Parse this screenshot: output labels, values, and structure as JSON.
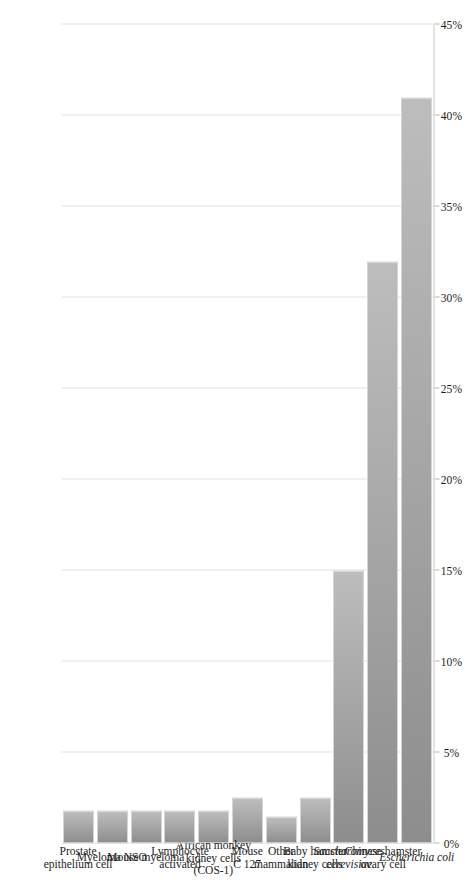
{
  "chart_data": {
    "type": "bar",
    "orientation": "horizontal-rotated",
    "title": "",
    "xlabel": "",
    "ylabel": "",
    "categories": [
      "Escherichia coli",
      "Chinese hamster ovary cell",
      "Saccharomyces cerevisiae",
      "Baby hamster kidney cells",
      "Other mammalian",
      "Mouse C 127",
      "African monkey kidney cells (COS-1)",
      "Lymphocyte activated",
      "Mouse myeloma",
      "Myeloma NSO",
      "Prostate epithelium cell"
    ],
    "categories_lines": [
      [
        "Escherichia coli"
      ],
      [
        "Chinese hamster",
        "ovary cell"
      ],
      [
        "Saccharomyces",
        "cerevisiae"
      ],
      [
        "Baby hamster",
        "kidney cells"
      ],
      [
        "Other",
        "mammalian"
      ],
      [
        "Mouse",
        "C 127"
      ],
      [
        "African monkey",
        "kidney cells",
        "(COS-1)"
      ],
      [
        "Lymphocyte",
        "activated"
      ],
      [
        "Mouse myeloma"
      ],
      [
        "Myeloma NSO"
      ],
      [
        "Prostate",
        "epithelium cell"
      ]
    ],
    "categories_italic": [
      true,
      false,
      true,
      false,
      false,
      false,
      false,
      false,
      false,
      false,
      false
    ],
    "values": [
      41.0,
      32.0,
      15.0,
      2.5,
      1.5,
      2.5,
      1.8,
      1.8,
      1.8,
      1.8,
      1.8
    ],
    "value_unit": "%",
    "xlim": [
      0,
      45
    ],
    "tick_values": [
      0,
      5,
      10,
      15,
      20,
      25,
      30,
      35,
      40,
      45
    ],
    "tick_labels": [
      "0%",
      "5%",
      "10%",
      "15%",
      "20%",
      "25%",
      "30%",
      "35%",
      "40%",
      "45%"
    ],
    "grid": true,
    "legend": "none",
    "bar_color_light": "#bdbdbd",
    "bar_color_dark": "#8d8d8d",
    "gridline_color": "#e2e2e2",
    "axis_color": "#c9c9c9"
  }
}
